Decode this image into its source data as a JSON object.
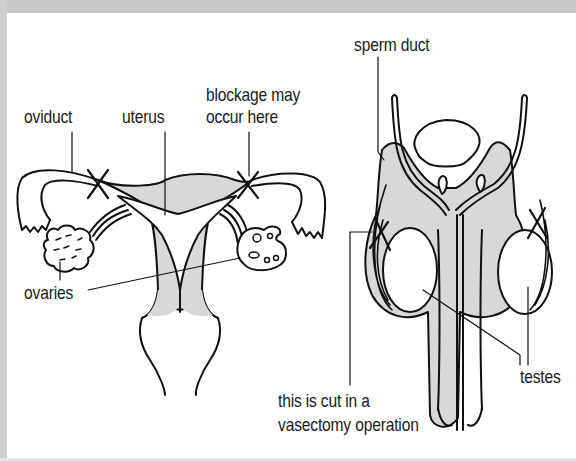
{
  "diagram": {
    "colors": {
      "background": "#ffffff",
      "tissue_fill": "#d8d8d8",
      "outline": "#111111",
      "frame": "#c9c9c9"
    },
    "female": {
      "labels": {
        "oviduct": "oviduct",
        "uterus": "uterus",
        "blockage_line1": "blockage may",
        "blockage_line2": "occur here",
        "ovaries": "ovaries"
      }
    },
    "male": {
      "labels": {
        "sperm_duct": "sperm duct",
        "vasectomy_line1": "this is cut in a",
        "vasectomy_line2": "vasectomy operation",
        "testes": "testes"
      }
    },
    "markers": [
      {
        "name": "left-oviduct-cut",
        "symbol": "X"
      },
      {
        "name": "right-oviduct-cut",
        "symbol": "X"
      },
      {
        "name": "left-sperm-duct-cut",
        "symbol": "X"
      },
      {
        "name": "right-sperm-duct-cut",
        "symbol": "X"
      }
    ]
  }
}
